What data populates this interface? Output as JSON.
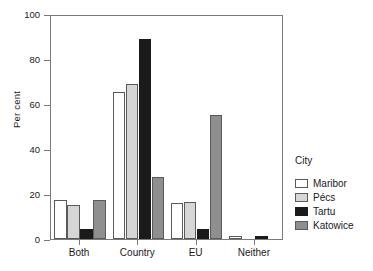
{
  "chart_data": {
    "type": "bar",
    "title": "",
    "xlabel": "",
    "ylabel": "Per cent",
    "ylim": [
      0,
      100
    ],
    "yticks": [
      0,
      20,
      40,
      60,
      80,
      100
    ],
    "ytick_labels": [
      "0",
      "20",
      "40",
      "60",
      "80",
      "100"
    ],
    "grid": false,
    "categories": [
      "Both",
      "Country",
      "EU",
      "Neither"
    ],
    "legend_title": "City",
    "legend_position": "right",
    "series": [
      {
        "name": "Maribor",
        "color": "#ffffff",
        "values": [
          17.5,
          65.5,
          16.0,
          1.5
        ]
      },
      {
        "name": "Pécs",
        "color": "#d6d6d6",
        "values": [
          15.0,
          69.0,
          16.5,
          0.0
        ]
      },
      {
        "name": "Tartu",
        "color": "#1a1a1a",
        "values": [
          4.5,
          89.0,
          4.5,
          1.5
        ]
      },
      {
        "name": "Katowice",
        "color": "#8f8f8f",
        "values": [
          17.5,
          27.5,
          55.0,
          0.0
        ]
      }
    ]
  },
  "legend": {
    "title": "City",
    "entries": [
      {
        "label": "Maribor",
        "color": "#ffffff"
      },
      {
        "label": "Pécs",
        "color": "#d6d6d6"
      },
      {
        "label": "Tartu",
        "color": "#1a1a1a"
      },
      {
        "label": "Katowice",
        "color": "#8f8f8f"
      }
    ]
  }
}
